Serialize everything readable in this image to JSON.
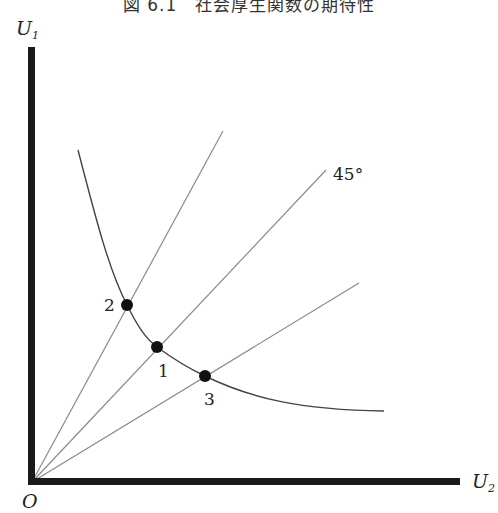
{
  "title": "図 6.1　社会厚生関数の期待性",
  "axes": {
    "y_label": "U",
    "y_label_sub": "1",
    "x_label": "U",
    "x_label_sub": "2",
    "origin_label": "O"
  },
  "annotations": {
    "angle_label": "45°"
  },
  "points": [
    {
      "label": "2",
      "x": 127,
      "y": 305
    },
    {
      "label": "1",
      "x": 157,
      "y": 347
    },
    {
      "label": "3",
      "x": 205,
      "y": 376
    }
  ],
  "rays": [
    {
      "name": "upper-ray",
      "x1": 32,
      "y1": 482,
      "x2": 223,
      "y2": 131
    },
    {
      "name": "45-degree-ray",
      "x1": 32,
      "y1": 482,
      "x2": 326,
      "y2": 170
    },
    {
      "name": "lower-ray",
      "x1": 32,
      "y1": 482,
      "x2": 359,
      "y2": 283
    }
  ],
  "colors": {
    "axis": "#1a1a1a",
    "line": "#8a8a8a",
    "curve": "#444444",
    "point": "#111111"
  }
}
